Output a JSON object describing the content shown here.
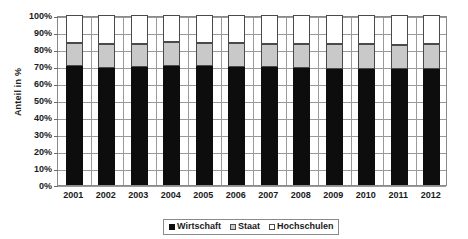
{
  "chart_data": {
    "type": "bar",
    "subtype": "stacked-100-percent",
    "title": "",
    "xlabel": "",
    "ylabel": "Anteil in %",
    "ylim": [
      0,
      100
    ],
    "ytick_labels": [
      "100%",
      "90%",
      "80%",
      "70%",
      "60%",
      "50%",
      "40%",
      "30%",
      "20%",
      "10%",
      "0%"
    ],
    "ytick_values": [
      100,
      90,
      80,
      70,
      60,
      50,
      40,
      30,
      20,
      10,
      0
    ],
    "grid": true,
    "legend_position": "bottom-center",
    "categories": [
      "2001",
      "2002",
      "2003",
      "2004",
      "2005",
      "2006",
      "2007",
      "2008",
      "2009",
      "2010",
      "2011",
      "2012"
    ],
    "series": [
      {
        "name": "Wirtschaft",
        "color": "#0d0d0d",
        "values": [
          69.9,
          69.1,
          69.5,
          69.9,
          69.8,
          69.4,
          69.5,
          69.0,
          68.1,
          68.0,
          68.3,
          68.5
        ]
      },
      {
        "name": "Staat",
        "color": "#c9c9c9",
        "values": [
          13.9,
          14.0,
          13.5,
          14.1,
          14.0,
          13.9,
          13.7,
          14.2,
          14.8,
          14.7,
          14.3,
          14.2
        ]
      },
      {
        "name": "Hochschulen",
        "color": "#ffffff",
        "values": [
          16.2,
          16.9,
          17.0,
          16.0,
          16.2,
          16.7,
          16.8,
          16.8,
          17.1,
          17.3,
          17.4,
          17.3
        ]
      }
    ]
  },
  "legend": {
    "items": [
      {
        "label": "Wirtschaft",
        "swatch": "sw-wirtschaft"
      },
      {
        "label": "Staat",
        "swatch": "sw-staat"
      },
      {
        "label": "Hochschulen",
        "swatch": "sw-hochschulen"
      }
    ]
  }
}
